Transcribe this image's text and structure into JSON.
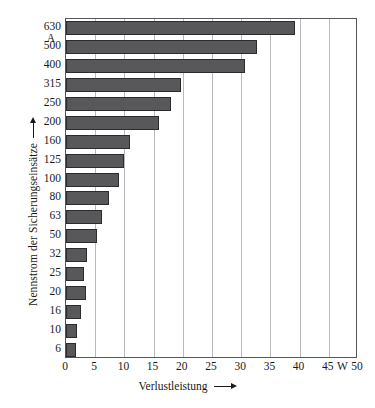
{
  "chart_data": {
    "type": "bar",
    "orientation": "horizontal",
    "title": "",
    "xlabel": "Verlustleistung",
    "ylabel": "Nennstrom der Sicherungseinsätze",
    "x_unit": "W",
    "y_unit": "A",
    "xlim": [
      0,
      50
    ],
    "ylim_categorical": true,
    "grid": "vertical",
    "legend": "none",
    "xticks": [
      0,
      5,
      10,
      15,
      20,
      25,
      30,
      35,
      40,
      45,
      50
    ],
    "xtick_labels": [
      "0",
      "5",
      "10",
      "15",
      "20",
      "25",
      "30",
      "35",
      "40",
      "45",
      "50"
    ],
    "categories": [
      "630",
      "500",
      "400",
      "315",
      "250",
      "200",
      "160",
      "125",
      "100",
      "80",
      "63",
      "50",
      "32",
      "25",
      "20",
      "16",
      "10",
      "6"
    ],
    "values": [
      39.2,
      32.7,
      30.6,
      19.7,
      17.9,
      15.9,
      10.9,
      10.0,
      9.0,
      7.3,
      6.2,
      5.3,
      3.6,
      3.1,
      3.4,
      2.6,
      1.9,
      1.7
    ],
    "bar_color": "#58585a",
    "bar_edge_color": "#2b2b2d",
    "grid_color": "#b9babd",
    "axis_color": "#55565a"
  },
  "axes": {
    "y_caption": "Nennstrom der Sicherungseinsätze",
    "y_unit_label": "A",
    "x_caption": "Verlustleistung",
    "x_unit_label": "W"
  }
}
